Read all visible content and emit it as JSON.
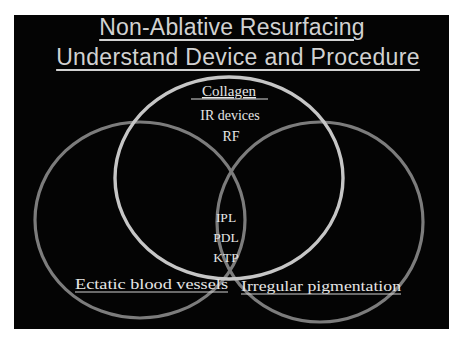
{
  "slide": {
    "title_line1": "Non-Ablative Resurfacing",
    "title_line2": "Understand Device and Procedure",
    "background_color": "#040404",
    "text_color": "#d2d2d2"
  },
  "venn": {
    "sets": [
      {
        "id": "collagen",
        "label": "Collagen",
        "color": "#c6c6c6"
      },
      {
        "id": "ectatic",
        "label": "Ectatic blood vessels",
        "color": "#7c7c7c"
      },
      {
        "id": "pigment",
        "label": "Irregular pigmentation",
        "color": "#7c7c7c"
      }
    ],
    "regions": {
      "collagen_only": [
        "IR devices",
        "RF"
      ],
      "all_three": [
        "IPL",
        "PDL",
        "KTP"
      ]
    }
  }
}
